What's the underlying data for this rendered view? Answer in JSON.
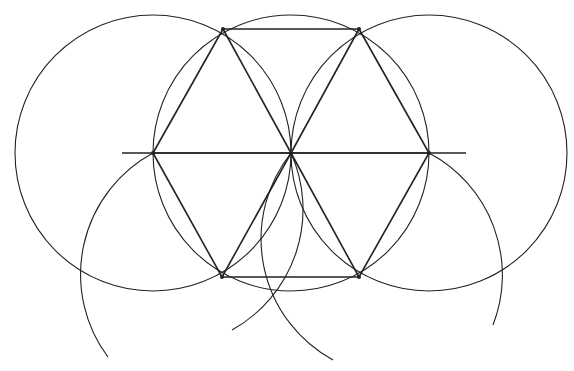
{
  "diagram": {
    "radius": 138,
    "center": [
      291,
      153
    ],
    "vertices": [
      [
        223,
        29
      ],
      [
        359,
        29
      ],
      [
        429,
        153
      ],
      [
        359,
        277
      ],
      [
        222,
        277
      ],
      [
        153,
        153
      ]
    ],
    "axis_line": {
      "x1": 122,
      "x2": 466,
      "y": 153
    },
    "full_circles": [
      [
        153,
        153
      ],
      [
        291,
        153
      ],
      [
        429,
        153
      ]
    ],
    "arcs": [
      {
        "center": [
          222,
          277
        ],
        "from": [
          153,
          153
        ],
        "to": [
          108,
          357
        ],
        "sweep": 0
      },
      {
        "center": [
          222,
          277
        ],
        "from": [
          291,
          153
        ],
        "to": [
          232,
          330
        ],
        "sweep": 1
      },
      {
        "center": [
          359,
          277
        ],
        "from": [
          291,
          153
        ],
        "to": [
          333,
          360
        ],
        "sweep": 0
      },
      {
        "center": [
          359,
          277
        ],
        "from": [
          429,
          153
        ],
        "to": [
          493,
          325
        ],
        "sweep": 1
      }
    ],
    "stroke": "#222222",
    "background": "#ffffff"
  }
}
